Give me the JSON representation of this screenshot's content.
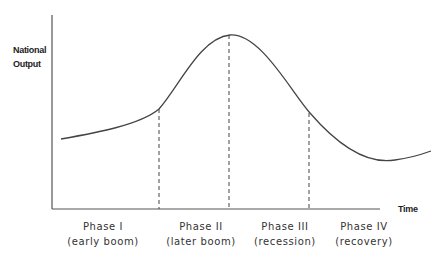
{
  "diagram": {
    "y_axis_label_line1": "National",
    "y_axis_label_line2": "Output",
    "x_axis_label": "Time",
    "phases": [
      {
        "name": "Phase I",
        "desc": "(early boom)"
      },
      {
        "name": "Phase II",
        "desc": "(later boom)"
      },
      {
        "name": "Phase III",
        "desc": "(recession)"
      },
      {
        "name": "Phase IV",
        "desc": "(recovery)"
      }
    ],
    "colors": {
      "line": "#444444",
      "text": "#222222"
    }
  }
}
